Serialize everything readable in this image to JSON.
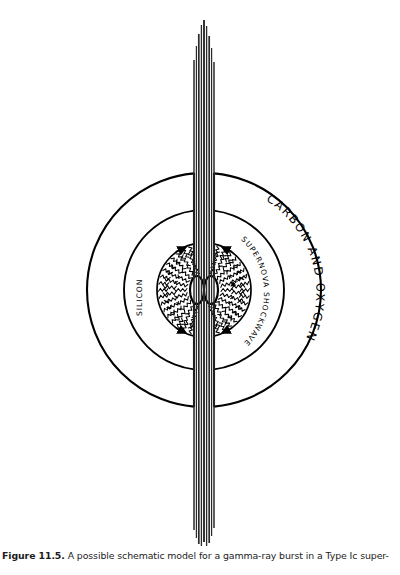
{
  "figure": {
    "number": "Figure 11.5.",
    "caption_text": "A possible schematic model for a gamma-ray burst in a Type Ic super-",
    "caption_full": "Figure 11.5. A possible schematic model for a gamma-ray burst in a Type Ic super-"
  },
  "labels": {
    "outer_shell": "CARBON AND OXYGEN",
    "middle_shell": "SILICON",
    "shockwave": "SUPERNOVA SHOCKWAVE"
  },
  "colors": {
    "background": "#ffffff",
    "ink": "#000000",
    "jet": "#2a2a2a",
    "caption": "#1c1c1c"
  },
  "geometry": {
    "center_x": 204,
    "center_y": 290,
    "outer_radius": 117,
    "middle_radius": 80,
    "shock_radius": 47,
    "jet_half_width": 10,
    "jet_top_y": 20,
    "jet_bottom_y": 546,
    "core_ellipse_rx": 7,
    "core_ellipse_ry": 14
  },
  "chart_data": {
    "type": "diagram",
    "components": [
      {
        "name": "carbon-and-oxygen-shell",
        "label": "CARBON AND OXYGEN",
        "shape": "circle",
        "radius": 117
      },
      {
        "name": "silicon-shell",
        "label": "SILICON",
        "shape": "circle",
        "radius": 80
      },
      {
        "name": "supernova-shockwave",
        "label": "SUPERNOVA SHOCKWAVE",
        "shape": "ring",
        "radius": 47
      },
      {
        "name": "relativistic-jet",
        "label": "",
        "shape": "bipolar-jet",
        "orientation": "vertical"
      },
      {
        "name": "central-engine",
        "label": "",
        "shape": "double-ellipse"
      }
    ]
  }
}
